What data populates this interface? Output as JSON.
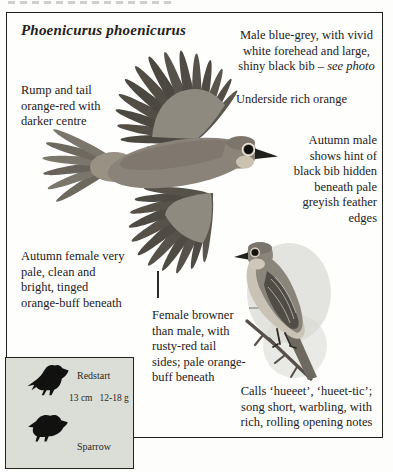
{
  "panel": {
    "species_name": "Phoenicurus phoenicurus",
    "male": {
      "lines": [
        "Male blue-grey, with vivid",
        "white forehead and large,",
        "shiny black bib – "
      ],
      "tail_italic": "see photo"
    },
    "rump": {
      "lines": [
        "Rump and tail",
        "orange-red with",
        "darker centre"
      ]
    },
    "underside": "Underside rich orange",
    "autumn_male": {
      "lines": [
        "Autumn male",
        "shows hint of",
        "black bib hidden",
        "beneath pale",
        "greyish feather",
        "edges"
      ]
    },
    "autumn_female": {
      "lines": [
        "Autumn female very",
        "pale, clean and",
        "bright, tinged",
        "orange-buff beneath"
      ]
    },
    "female": {
      "lines": [
        "Female browner",
        "than male, with",
        "rusty-red tail",
        "sides; pale orange-",
        "buff beneath"
      ]
    },
    "calls": {
      "lines": [
        "Calls ‘hueeet’, ‘hueet-tic’;",
        "song short, warbling, with",
        "rich, rolling opening notes"
      ]
    }
  },
  "size_box": {
    "species_label": "Redstart",
    "length": "13 cm",
    "weight": "12-18 g",
    "comparison_label": "Sparrow"
  },
  "colors": {
    "ink": "#23211e",
    "panel_border": "#1e1e1c",
    "size_box_bg": "#dbded6",
    "plumage_dark": "#4b4841",
    "plumage_mid": "#8a8379",
    "plumage_pale": "#cbc2b2"
  }
}
